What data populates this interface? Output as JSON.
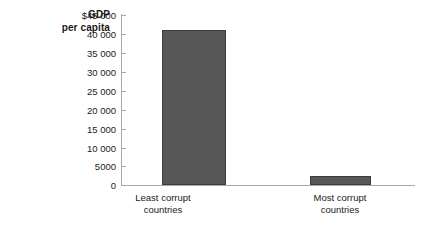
{
  "chart_data": {
    "type": "bar",
    "title": "",
    "subtitle": "",
    "xlabel": "",
    "ylabel": "GDP per capita",
    "ylabel_lines": [
      "GDP",
      "per capita"
    ],
    "categories": [
      "Least corrupt countries",
      "Most corrupt countries"
    ],
    "category_lines": [
      [
        "Least corrupt",
        "countries"
      ],
      [
        "Most corrupt",
        "countries"
      ]
    ],
    "values": [
      41000,
      2500
    ],
    "ylim": [
      0,
      45000
    ],
    "ytick_values": [
      45000,
      40000,
      35000,
      30000,
      25000,
      20000,
      15000,
      10000,
      5000,
      0
    ],
    "ytick_labels": [
      "$45 000",
      "40 000",
      "35 000",
      "30 000",
      "25 000",
      "20 000",
      "15 000",
      "10 000",
      "5000",
      "0"
    ],
    "grid": false,
    "legend": null,
    "legend_position": "none",
    "currency_symbol": "$",
    "bar_color": "#575757",
    "bar_border_color": "#3d3d3d",
    "axis_color": "#a8a8a8",
    "background_color": "#ffffff",
    "text_color": "#1a1a1a"
  }
}
